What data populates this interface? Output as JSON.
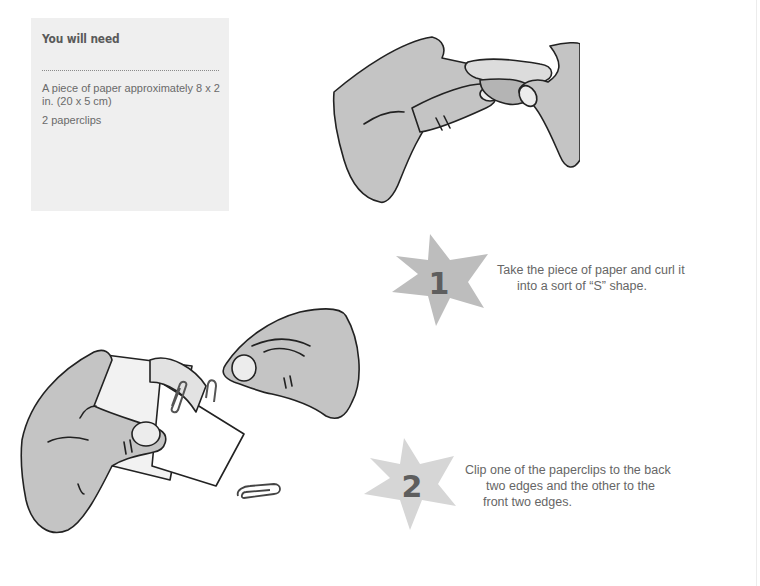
{
  "needs": {
    "title": "You will need",
    "items": [
      "A piece of paper approximately 8 x 2 in. (20 x 5 cm)",
      "2 paperclips"
    ],
    "background": "#efefef"
  },
  "steps": [
    {
      "number": "1",
      "lines": [
        "Take the piece of paper and curl it",
        "into a sort of “S” shape."
      ],
      "star_color": "#bdbdbd"
    },
    {
      "number": "2",
      "lines": [
        "Clip one of the paperclips to the back",
        "two edges and the other to the",
        "front two edges."
      ],
      "star_color": "#d6d6d6"
    }
  ],
  "illustrations": [
    {
      "name": "hands-curling-paper"
    },
    {
      "name": "hands-clipping-paper"
    }
  ]
}
